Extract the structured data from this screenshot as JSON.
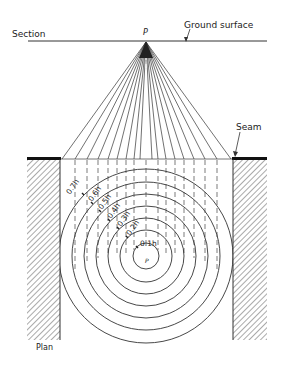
{
  "labels": {
    "section": "Section",
    "ground_surface": "Ground surface",
    "point_top": "P",
    "seam": "Seam",
    "plan": "Plan",
    "point_center": "P"
  },
  "radii_labels": [
    "0.1h",
    "0.2h",
    "0.3h",
    "0.4h",
    "0.5h",
    "0.6h",
    "0.7h"
  ],
  "colors": {
    "line": "#333333",
    "seam": "#111111",
    "background": "#ffffff"
  }
}
